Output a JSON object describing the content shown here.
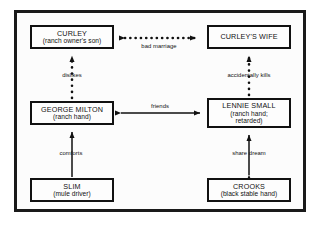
{
  "diagram": {
    "frame": {
      "border_color": "#1a1a1a",
      "background": "#fcfcfc"
    },
    "nodes": [
      {
        "id": "curley",
        "title": "CURLEY",
        "subtitle": "(ranch owner's son)",
        "subtitle2": ""
      },
      {
        "id": "curleys_wife",
        "title": "CURLEY'S WIFE",
        "subtitle": "",
        "subtitle2": ""
      },
      {
        "id": "george_milton",
        "title": "GEORGE MILTON",
        "subtitle": "(ranch hand)",
        "subtitle2": ""
      },
      {
        "id": "lennie_small",
        "title": "LENNIE SMALL",
        "subtitle": "(ranch hand;",
        "subtitle2": "retarded)"
      },
      {
        "id": "slim",
        "title": "SLIM",
        "subtitle": "(mule driver)",
        "subtitle2": ""
      },
      {
        "id": "crooks",
        "title": "CROOKS",
        "subtitle": "(black stable hand)",
        "subtitle2": ""
      }
    ],
    "edges": [
      {
        "id": "bad_marriage",
        "label": "bad marriage",
        "from": "curley",
        "to": "curleys_wife",
        "style": "dotted",
        "heads": "double",
        "orientation": "horizontal"
      },
      {
        "id": "dislikes",
        "label": "dislikes",
        "from": "george_milton",
        "to": "curley",
        "style": "dotted",
        "heads": "single-up",
        "orientation": "vertical"
      },
      {
        "id": "accidentally_kills",
        "label": "accidentally kills",
        "from": "lennie_small",
        "to": "curleys_wife",
        "style": "dotted",
        "heads": "single-up",
        "orientation": "vertical"
      },
      {
        "id": "friends",
        "label": "friends",
        "from": "george_milton",
        "to": "lennie_small",
        "style": "solid",
        "heads": "double",
        "orientation": "horizontal"
      },
      {
        "id": "comforts",
        "label": "comforts",
        "from": "slim",
        "to": "george_milton",
        "style": "solid",
        "heads": "single-up",
        "orientation": "vertical"
      },
      {
        "id": "share_dream",
        "label": "share dream",
        "from": "lennie_small",
        "to": "crooks",
        "style": "solid",
        "heads": "double",
        "orientation": "vertical"
      }
    ],
    "colors": {
      "line": "#111111",
      "text": "#111111",
      "node_fill": "#fdfdfd"
    }
  }
}
